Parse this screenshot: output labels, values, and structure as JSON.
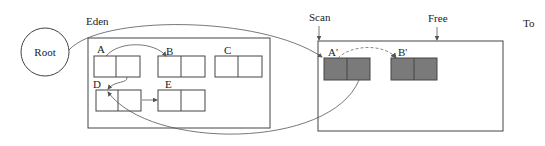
{
  "diagram": {
    "type": "copying-garbage-collection",
    "colors": {
      "line": "#444444",
      "copied_fill": "#7a7a7a",
      "dashed": "#888888",
      "background": "#ffffff"
    },
    "root": {
      "label": "Root"
    },
    "eden": {
      "label": "Eden",
      "objects": [
        {
          "id": "A",
          "label": "A"
        },
        {
          "id": "B",
          "label": "B"
        },
        {
          "id": "C",
          "label": "C"
        },
        {
          "id": "D",
          "label": "D"
        },
        {
          "id": "E",
          "label": "E"
        }
      ]
    },
    "to_space": {
      "label": "To",
      "pointers": {
        "scan": "Scan",
        "free": "Free"
      },
      "objects": [
        {
          "id": "A'",
          "label": "A'"
        },
        {
          "id": "B'",
          "label": "B'"
        }
      ]
    },
    "edges": [
      {
        "from": "Root",
        "to": "A'",
        "style": "solid"
      },
      {
        "from": "A",
        "to": "B",
        "style": "solid"
      },
      {
        "from": "A",
        "to": "D",
        "style": "solid"
      },
      {
        "from": "D",
        "to": "E",
        "style": "solid"
      },
      {
        "from": "A'",
        "to": "D",
        "style": "solid"
      },
      {
        "from": "A'",
        "to": "B'",
        "style": "dashed"
      }
    ]
  }
}
